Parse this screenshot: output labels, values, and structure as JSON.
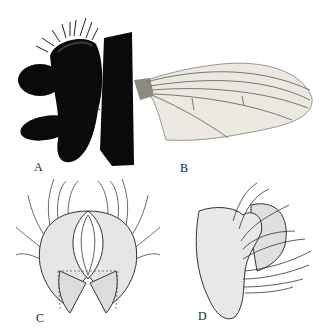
{
  "figure": {
    "panels": [
      {
        "id": "A",
        "label": "A",
        "subject": "head-lateral-view-photo"
      },
      {
        "id": "B",
        "label": "B",
        "subject": "wing-photo"
      },
      {
        "id": "C",
        "label": "C",
        "subject": "genitalia-ventral-drawing"
      },
      {
        "id": "D",
        "label": "D",
        "subject": "genitalia-lateral-drawing"
      }
    ]
  },
  "colors": {
    "background": "#ffffff",
    "silhouette": "#0a0a0a",
    "wing_fill": "#ece9e3",
    "wing_vein": "#6e6a64",
    "drawing_stroke": "#333333",
    "drawing_fill": "#e6e6e6"
  }
}
